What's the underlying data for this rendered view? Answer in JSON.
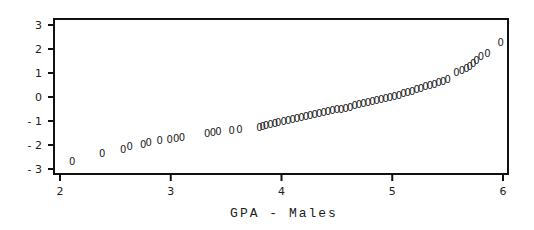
{
  "chart_data": {
    "type": "scatter",
    "title": "",
    "xlabel": "GPA - Males",
    "ylabel": "",
    "xlim": [
      2,
      6
    ],
    "ylim": [
      -3,
      3
    ],
    "xticks": [
      2,
      3,
      4,
      5,
      6
    ],
    "yticks": [
      3,
      2,
      1,
      0,
      -1,
      -2,
      -3
    ],
    "grid": false,
    "legend": null,
    "marker": "0",
    "series": [
      {
        "name": "Normal quantile vs GPA (Males)",
        "points": [
          [
            2.11,
            -2.67
          ],
          [
            2.38,
            -2.33
          ],
          [
            2.57,
            -2.17
          ],
          [
            2.63,
            -2.04
          ],
          [
            2.75,
            -1.96
          ],
          [
            2.8,
            -1.88
          ],
          [
            2.9,
            -1.8
          ],
          [
            2.99,
            -1.76
          ],
          [
            3.05,
            -1.71
          ],
          [
            3.1,
            -1.65
          ],
          [
            3.33,
            -1.5
          ],
          [
            3.38,
            -1.45
          ],
          [
            3.43,
            -1.42
          ],
          [
            3.55,
            -1.37
          ],
          [
            3.62,
            -1.33
          ],
          [
            3.8,
            -1.25
          ],
          [
            3.83,
            -1.2
          ],
          [
            3.86,
            -1.17
          ],
          [
            3.9,
            -1.12
          ],
          [
            3.94,
            -1.08
          ],
          [
            3.97,
            -1.04
          ],
          [
            4.02,
            -1.0
          ],
          [
            4.06,
            -0.96
          ],
          [
            4.1,
            -0.92
          ],
          [
            4.14,
            -0.88
          ],
          [
            4.18,
            -0.84
          ],
          [
            4.22,
            -0.8
          ],
          [
            4.26,
            -0.76
          ],
          [
            4.3,
            -0.72
          ],
          [
            4.34,
            -0.68
          ],
          [
            4.38,
            -0.64
          ],
          [
            4.42,
            -0.6
          ],
          [
            4.46,
            -0.56
          ],
          [
            4.5,
            -0.52
          ],
          [
            4.54,
            -0.48
          ],
          [
            4.58,
            -0.44
          ],
          [
            4.62,
            -0.4
          ],
          [
            4.66,
            -0.35
          ],
          [
            4.7,
            -0.3
          ],
          [
            4.74,
            -0.26
          ],
          [
            4.78,
            -0.22
          ],
          [
            4.82,
            -0.17
          ],
          [
            4.86,
            -0.12
          ],
          [
            4.9,
            -0.08
          ],
          [
            4.94,
            -0.04
          ],
          [
            4.98,
            0.0
          ],
          [
            5.02,
            0.05
          ],
          [
            5.06,
            0.1
          ],
          [
            5.1,
            0.15
          ],
          [
            5.14,
            0.2
          ],
          [
            5.18,
            0.26
          ],
          [
            5.22,
            0.32
          ],
          [
            5.26,
            0.38
          ],
          [
            5.3,
            0.44
          ],
          [
            5.34,
            0.5
          ],
          [
            5.38,
            0.56
          ],
          [
            5.42,
            0.62
          ],
          [
            5.46,
            0.68
          ],
          [
            5.5,
            0.74
          ],
          [
            5.58,
            1.05
          ],
          [
            5.63,
            1.12
          ],
          [
            5.67,
            1.2
          ],
          [
            5.7,
            1.3
          ],
          [
            5.73,
            1.42
          ],
          [
            5.76,
            1.55
          ],
          [
            5.8,
            1.7
          ],
          [
            5.86,
            1.85
          ],
          [
            5.98,
            2.3
          ]
        ]
      }
    ]
  }
}
